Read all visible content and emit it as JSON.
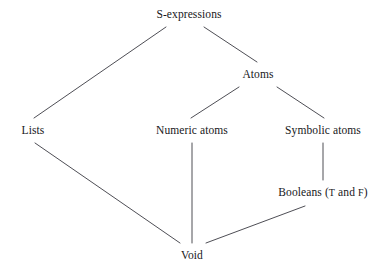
{
  "diagram": {
    "kind": "hasse-lattice",
    "background_color": "#ffffff",
    "line_color": "#3a3a42",
    "text_color": "#17171a",
    "nodes": [
      {
        "id": "s-expressions",
        "label": "S-expressions",
        "x": 189,
        "y": 14
      },
      {
        "id": "atoms",
        "label": "Atoms",
        "x": 258,
        "y": 74
      },
      {
        "id": "lists",
        "label": "Lists",
        "x": 33,
        "y": 130
      },
      {
        "id": "numeric-atoms",
        "label": "Numeric atoms",
        "x": 192,
        "y": 130
      },
      {
        "id": "symbolic-atoms",
        "label": "Symbolic atoms",
        "x": 323,
        "y": 130
      },
      {
        "id": "booleans",
        "label": "Booleans (T and F)",
        "x": 323,
        "y": 192,
        "parts": [
          {
            "text": "Booleans (",
            "style": "normal"
          },
          {
            "text": "T",
            "style": "smallcap"
          },
          {
            "text": " and ",
            "style": "normal"
          },
          {
            "text": "F",
            "style": "smallcap"
          },
          {
            "text": ")",
            "style": "normal"
          }
        ]
      },
      {
        "id": "void",
        "label": "Void",
        "x": 192,
        "y": 255
      }
    ],
    "edges": [
      {
        "id": "s-expressions--lists",
        "from": "s-expressions",
        "to": "lists",
        "x1": 166,
        "y1": 27,
        "x2": 34,
        "y2": 118
      },
      {
        "id": "s-expressions--atoms",
        "from": "s-expressions",
        "to": "atoms",
        "x1": 204,
        "y1": 27,
        "x2": 257,
        "y2": 62
      },
      {
        "id": "atoms--numeric-atoms",
        "from": "atoms",
        "to": "numeric-atoms",
        "x1": 239,
        "y1": 87,
        "x2": 191,
        "y2": 118
      },
      {
        "id": "atoms--symbolic-atoms",
        "from": "atoms",
        "to": "symbolic-atoms",
        "x1": 277,
        "y1": 87,
        "x2": 324,
        "y2": 118
      },
      {
        "id": "symbolic-atoms--booleans",
        "from": "symbolic-atoms",
        "to": "booleans",
        "x1": 323,
        "y1": 143,
        "x2": 323,
        "y2": 180
      },
      {
        "id": "numeric-atoms--void",
        "from": "numeric-atoms",
        "to": "void",
        "x1": 192,
        "y1": 143,
        "x2": 192,
        "y2": 243
      },
      {
        "id": "lists--void",
        "from": "lists",
        "to": "void",
        "x1": 35,
        "y1": 143,
        "x2": 180,
        "y2": 243
      },
      {
        "id": "booleans--void",
        "from": "booleans",
        "to": "void",
        "x1": 305,
        "y1": 206,
        "x2": 206,
        "y2": 243
      }
    ]
  }
}
